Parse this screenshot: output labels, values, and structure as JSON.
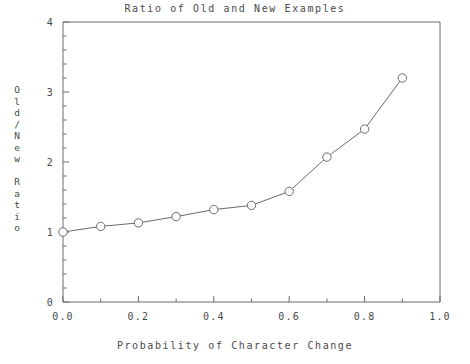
{
  "chart_data": {
    "type": "line",
    "title": "Ratio of Old and New Examples",
    "xlabel": "Probability of Character Change",
    "ylabel": "Old/New Ratio",
    "ylabel_stacked": [
      "O",
      "l",
      "d",
      "/",
      "N",
      "e",
      "w",
      "",
      "R",
      "a",
      "t",
      "i",
      "o"
    ],
    "x": [
      0.0,
      0.1,
      0.2,
      0.3,
      0.4,
      0.5,
      0.6,
      0.7,
      0.8,
      0.9
    ],
    "values": [
      1.0,
      1.08,
      1.13,
      1.22,
      1.32,
      1.38,
      1.58,
      2.07,
      2.47,
      3.2
    ],
    "series": [
      {
        "name": "Old/New Ratio",
        "marker": "open-circle",
        "values": [
          1.0,
          1.08,
          1.13,
          1.22,
          1.32,
          1.38,
          1.58,
          2.07,
          2.47,
          3.2
        ]
      }
    ],
    "xlim": [
      0.0,
      1.0
    ],
    "ylim": [
      0,
      4
    ],
    "xticks": [
      0.0,
      0.2,
      0.4,
      0.6,
      0.8,
      1.0
    ],
    "xtick_labels": [
      "0.0",
      "0.2",
      "0.4",
      "0.6",
      "0.8",
      "1.0"
    ],
    "xminor_step": 0.1,
    "yticks": [
      0,
      1,
      2,
      3,
      4
    ],
    "ytick_labels": [
      "0",
      "1",
      "2",
      "3",
      "4"
    ],
    "yminor_step": 0.2,
    "grid": false,
    "legend": null,
    "line_color": "#6b6b6b",
    "marker_color": "#6b6b6b",
    "axis_color": "#6b6b6b"
  }
}
